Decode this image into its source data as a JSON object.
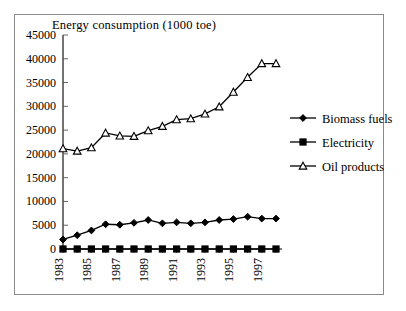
{
  "chart_data": {
    "type": "line",
    "title": "Energy consumption (1000 toe)",
    "xlabel": "",
    "ylabel": "",
    "ylim": [
      0,
      45000
    ],
    "ytick_values": [
      0,
      5000,
      10000,
      15000,
      20000,
      25000,
      30000,
      35000,
      40000,
      45000
    ],
    "ytick_labels": [
      "0",
      "5000",
      "10000",
      "15000",
      "20000",
      "25000",
      "30000",
      "35000",
      "40000",
      "45000"
    ],
    "categories": [
      1983,
      1984,
      1985,
      1986,
      1987,
      1988,
      1989,
      1990,
      1991,
      1992,
      1993,
      1994,
      1995,
      1996,
      1997,
      1998
    ],
    "xtick_labels_shown": [
      "1983",
      "",
      "1985",
      "",
      "1987",
      "",
      "1989",
      "",
      "1991",
      "",
      "1993",
      "",
      "1995",
      "",
      "1997",
      ""
    ],
    "grid": false,
    "legend_position": "right",
    "series": [
      {
        "name": "Biomass fuels",
        "marker": "filled-diamond",
        "values": [
          2000,
          2900,
          3900,
          5200,
          5100,
          5500,
          6100,
          5400,
          5600,
          5400,
          5600,
          6100,
          6300,
          6800,
          6400,
          6400
        ]
      },
      {
        "name": "Electricity",
        "marker": "filled-square",
        "values": [
          0,
          0,
          0,
          0,
          0,
          0,
          0,
          0,
          0,
          0,
          0,
          0,
          0,
          0,
          0,
          0
        ]
      },
      {
        "name": "Oil products",
        "marker": "open-triangle",
        "values": [
          21100,
          20600,
          21300,
          24400,
          23800,
          23700,
          24900,
          25800,
          27200,
          27400,
          28400,
          29900,
          33000,
          36100,
          39000,
          39000
        ]
      }
    ]
  },
  "legend": {
    "items": [
      {
        "label": "Biomass fuels"
      },
      {
        "label": "Electricity"
      },
      {
        "label": "Oil products"
      }
    ]
  }
}
